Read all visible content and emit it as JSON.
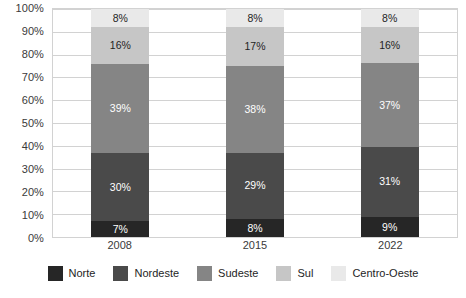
{
  "chart_data": {
    "type": "bar",
    "stacked": true,
    "stack_mode": "percent",
    "title": "",
    "subtitle": "",
    "xlabel": "",
    "ylabel": "",
    "categories": [
      "2008",
      "2015",
      "2022"
    ],
    "ylim": [
      0,
      100
    ],
    "ytick_labels": [
      "0%",
      "10%",
      "20%",
      "30%",
      "40%",
      "50%",
      "60%",
      "70%",
      "80%",
      "90%",
      "100%"
    ],
    "ytick_values": [
      0,
      10,
      20,
      30,
      40,
      50,
      60,
      70,
      80,
      90,
      100
    ],
    "value_suffix": "%",
    "grid": true,
    "grid_axis": "y",
    "legend_position": "bottom",
    "series": [
      {
        "name": "Norte",
        "color": "#262626",
        "label_color": "#ffffff",
        "values": [
          7,
          8,
          9
        ],
        "labels": [
          "7%",
          "8%",
          "9%"
        ]
      },
      {
        "name": "Nordeste",
        "color": "#4a4a4a",
        "label_color": "#ffffff",
        "values": [
          30,
          29,
          31
        ],
        "labels": [
          "30%",
          "29%",
          "31%"
        ]
      },
      {
        "name": "Sudeste",
        "color": "#858585",
        "label_color": "#ffffff",
        "values": [
          39,
          38,
          37
        ],
        "labels": [
          "39%",
          "38%",
          "37%"
        ]
      },
      {
        "name": "Sul",
        "color": "#c6c6c6",
        "label_color": "#1e1e1e",
        "values": [
          16,
          17,
          16
        ],
        "labels": [
          "16%",
          "17%",
          "16%"
        ]
      },
      {
        "name": "Centro-Oeste",
        "color": "#e9e9e9",
        "label_color": "#1e1e1e",
        "values": [
          8,
          8,
          8
        ],
        "labels": [
          "8%",
          "8%",
          "8%"
        ]
      }
    ]
  },
  "colors": {
    "grid": "#d2d2d2",
    "axis_text": "#3a3a3a",
    "legend_text": "#1e1e1e",
    "background": "#ffffff"
  }
}
